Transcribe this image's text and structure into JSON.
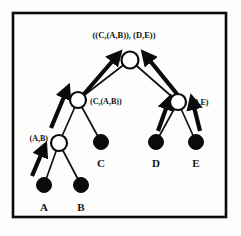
{
  "figure": {
    "type": "hierarchical-clustering-tree",
    "title": "",
    "border_color": "#0a0a0a",
    "background_color": "#fdfdfc",
    "leaf_node_color": "#0a0a0a",
    "internal_node_color": "#ffffff",
    "node_outline_color": "#0a0a0a",
    "arrow_color": "#0a0a0a",
    "branch_color": "#111111"
  },
  "labels": {
    "root": "((C,(A,B)), (D,E))",
    "left_internal": "(C,(A,B))",
    "right_internal": "(D,E)",
    "left_lower_internal": "(A,B)"
  },
  "leaves": [
    {
      "id": "A",
      "label": "A",
      "cx": 44,
      "cy": 185,
      "r": 7.5,
      "label_x": 44,
      "label_y": 210
    },
    {
      "id": "B",
      "label": "B",
      "cx": 81,
      "cy": 185,
      "r": 7.5,
      "label_x": 81,
      "label_y": 210
    },
    {
      "id": "C",
      "label": "C",
      "cx": 101,
      "cy": 142,
      "r": 7.5,
      "label_x": 101,
      "label_y": 166
    },
    {
      "id": "D",
      "label": "D",
      "cx": 156,
      "cy": 142,
      "r": 7.5,
      "label_x": 156,
      "label_y": 166
    },
    {
      "id": "E",
      "label": "E",
      "cx": 196,
      "cy": 142,
      "r": 7.5,
      "label_x": 196,
      "label_y": 166
    }
  ],
  "internal_nodes": [
    {
      "id": "root",
      "cx": 130,
      "cy": 60,
      "r": 8.5
    },
    {
      "id": "left_internal",
      "cx": 78,
      "cy": 100,
      "r": 8.0
    },
    {
      "id": "right_internal",
      "cx": 178,
      "cy": 102,
      "r": 8.0
    },
    {
      "id": "left_lower_internal",
      "cx": 59,
      "cy": 143,
      "r": 8.0
    }
  ],
  "label_positions": {
    "root": {
      "x": 124,
      "y": 38,
      "anchor": "middle"
    },
    "left_internal": {
      "x": 90,
      "y": 104,
      "anchor": "start"
    },
    "right_internal": {
      "x": 190,
      "y": 105,
      "anchor": "start"
    },
    "left_lower_internal": {
      "x": 46,
      "y": 141,
      "anchor": "end"
    }
  },
  "branches": [
    {
      "from": "root",
      "to": "left_internal",
      "x1": 130,
      "y1": 60,
      "x2": 78,
      "y2": 100
    },
    {
      "from": "root",
      "to": "right_internal",
      "x1": 130,
      "y1": 60,
      "x2": 178,
      "y2": 102
    },
    {
      "from": "left_internal",
      "to": "left_lower_internal",
      "x1": 78,
      "y1": 100,
      "x2": 59,
      "y2": 143
    },
    {
      "from": "left_internal",
      "to": "C",
      "x1": 78,
      "y1": 100,
      "x2": 101,
      "y2": 142
    },
    {
      "from": "left_lower_internal",
      "to": "A",
      "x1": 59,
      "y1": 143,
      "x2": 44,
      "y2": 185
    },
    {
      "from": "left_lower_internal",
      "to": "B",
      "x1": 59,
      "y1": 143,
      "x2": 81,
      "y2": 185
    },
    {
      "from": "right_internal",
      "to": "D",
      "x1": 178,
      "y1": 102,
      "x2": 156,
      "y2": 142
    },
    {
      "from": "right_internal",
      "to": "E",
      "x1": 178,
      "y1": 102,
      "x2": 196,
      "y2": 142
    }
  ],
  "arrows": [
    {
      "id": "arrow-to-root-left",
      "x1": 83,
      "y1": 93,
      "x2": 116,
      "y2": 56
    },
    {
      "id": "arrow-to-root-right",
      "x1": 178,
      "y1": 93,
      "x2": 146,
      "y2": 56
    },
    {
      "id": "arrow-to-left-internal",
      "x1": 51,
      "y1": 127,
      "x2": 66,
      "y2": 90
    },
    {
      "id": "arrow-to-left-lower-internal",
      "x1": 31,
      "y1": 176,
      "x2": 42,
      "y2": 149
    },
    {
      "id": "arrow-to-right-internal-from-d",
      "x1": 158,
      "y1": 131,
      "x2": 167,
      "y2": 101
    },
    {
      "id": "arrow-to-right-internal-from-e",
      "x1": 199,
      "y1": 131,
      "x2": 192,
      "y2": 101
    }
  ],
  "frame": {
    "x": 13,
    "y": 13,
    "width": 213,
    "height": 204
  }
}
